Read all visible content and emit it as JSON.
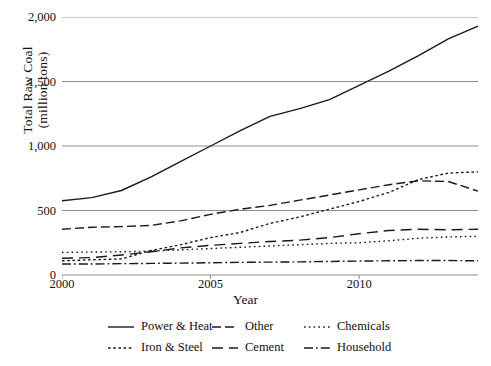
{
  "chart_data": {
    "type": "line",
    "title": "",
    "xlabel": "Year",
    "ylabel": "Total Raw Coal (million tons)",
    "ylabel_line1": "Total Raw Coal",
    "ylabel_line2": "(million tons)",
    "xlim": [
      2000,
      2014
    ],
    "ylim": [
      0,
      2000
    ],
    "yticks": [
      0,
      500,
      1000,
      1500,
      2000
    ],
    "ytick_labels": [
      "0",
      "500",
      "1,000",
      "1,500",
      "2,000"
    ],
    "xticks": [
      2000,
      2005,
      2010
    ],
    "xtick_labels": [
      "2000",
      "2005",
      "2010"
    ],
    "grid": "horizontal",
    "legend_position": "bottom",
    "x": [
      2000,
      2001,
      2002,
      2003,
      2004,
      2005,
      2006,
      2007,
      2008,
      2009,
      2010,
      2011,
      2012,
      2013,
      2014
    ],
    "series": [
      {
        "name": "Power & Heat",
        "linestyle": "solid",
        "values": [
          575,
          600,
          655,
          760,
          880,
          1000,
          1120,
          1230,
          1290,
          1360,
          1470,
          1580,
          1700,
          1830,
          1930
        ]
      },
      {
        "name": "Other",
        "linestyle": "dashed",
        "values": [
          355,
          370,
          375,
          385,
          420,
          470,
          510,
          540,
          580,
          620,
          660,
          700,
          730,
          725,
          650
        ]
      },
      {
        "name": "Chemicals",
        "linestyle": "dotted",
        "values": [
          175,
          178,
          180,
          185,
          195,
          205,
          215,
          225,
          235,
          245,
          250,
          265,
          285,
          295,
          300
        ]
      },
      {
        "name": "Iron & Steel",
        "linestyle": "finely-dotted",
        "values": [
          110,
          118,
          125,
          190,
          235,
          290,
          330,
          400,
          450,
          510,
          570,
          640,
          740,
          790,
          800
        ]
      },
      {
        "name": "Cement",
        "linestyle": "long-dashed",
        "values": [
          130,
          135,
          155,
          180,
          210,
          230,
          245,
          260,
          270,
          290,
          320,
          345,
          355,
          350,
          355
        ]
      },
      {
        "name": "Household",
        "linestyle": "dash-dot",
        "values": [
          85,
          85,
          88,
          90,
          92,
          95,
          98,
          100,
          102,
          105,
          108,
          110,
          112,
          112,
          110
        ]
      }
    ],
    "colors": {
      "line": "#1a1a1a",
      "grid": "#8c8c8c",
      "axis": "#8c8c8c",
      "text": "#111111"
    }
  },
  "legend": {
    "rows": [
      [
        {
          "label": "Power & Heat",
          "style": "solid"
        },
        {
          "label": "Other",
          "style": "dashed"
        },
        {
          "label": "Chemicals",
          "style": "dotted"
        }
      ],
      [
        {
          "label": "Iron & Steel",
          "style": "finely-dotted"
        },
        {
          "label": "Cement",
          "style": "long-dashed"
        },
        {
          "label": "Household",
          "style": "dash-dot"
        }
      ]
    ]
  }
}
